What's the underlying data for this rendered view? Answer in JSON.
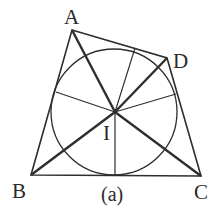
{
  "diagram": {
    "caption": "(a)",
    "colors": {
      "stroke": "#2e2e2e",
      "background": "#ffffff"
    },
    "points": {
      "A": {
        "label": "A",
        "x": 72,
        "y": 30
      },
      "D": {
        "label": "D",
        "x": 167,
        "y": 58
      },
      "B": {
        "label": "B",
        "x": 31,
        "y": 175
      },
      "C": {
        "label": "C",
        "x": 201,
        "y": 176
      },
      "I": {
        "label": "I",
        "x": 115,
        "y": 112
      }
    },
    "incircle": {
      "cx": 114,
      "cy": 112,
      "r": 63
    },
    "tangent_points": [
      {
        "x": 56,
        "y": 92
      },
      {
        "x": 135,
        "y": 48
      },
      {
        "x": 176,
        "y": 94
      },
      {
        "x": 115,
        "y": 175
      }
    ]
  }
}
